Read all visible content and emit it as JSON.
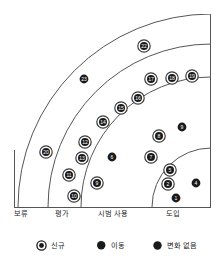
{
  "chart_data": {
    "type": "scatter",
    "chart_kind": "technology-radar-quadrant",
    "title": "",
    "xlabel": "",
    "ylabel": "",
    "rings": [
      {
        "name": "도입",
        "label": "도입",
        "order": 1
      },
      {
        "name": "시범 사용",
        "label": "시범 사용",
        "order": 2
      },
      {
        "name": "평가",
        "label": "평가",
        "order": 3
      },
      {
        "name": "보류",
        "label": "보류",
        "order": 4
      }
    ],
    "ring_labels": [
      "보류",
      "평가",
      "시범 사용",
      "도입"
    ],
    "legend": {
      "position": "bottom",
      "entries": [
        {
          "label": "신규",
          "marker": "ring-circle"
        },
        {
          "label": "이동",
          "marker": "moon-circle"
        },
        {
          "label": "변화 없음",
          "marker": "filled-circle"
        }
      ]
    },
    "points": [
      {
        "id": "1",
        "ring": "도입",
        "marker": "filled-circle",
        "x": 176,
        "y": 198
      },
      {
        "id": "2",
        "ring": "도입",
        "marker": "ring-circle",
        "x": 168,
        "y": 184
      },
      {
        "id": "4",
        "ring": "도입",
        "marker": "filled-circle",
        "x": 196,
        "y": 183
      },
      {
        "id": "5",
        "ring": "도입",
        "marker": "ring-circle",
        "x": 170,
        "y": 170
      },
      {
        "id": "7",
        "ring": "시범 사용",
        "marker": "ring-circle",
        "x": 151,
        "y": 157
      },
      {
        "id": "8",
        "ring": "시범 사용",
        "marker": "ring-circle",
        "x": 159,
        "y": 136
      },
      {
        "id": "9",
        "ring": "시범 사용",
        "marker": "moon-circle",
        "x": 182,
        "y": 127
      },
      {
        "id": "6",
        "ring": "시범 사용",
        "marker": "moon-circle",
        "x": 112,
        "y": 157
      },
      {
        "id": "9b",
        "ring": "시범 사용",
        "marker": "ring-circle",
        "x": 97,
        "y": 183,
        "display": "9"
      },
      {
        "id": "10",
        "ring": "평가",
        "marker": "ring-circle",
        "x": 74,
        "y": 196
      },
      {
        "id": "11",
        "ring": "평가",
        "marker": "ring-circle",
        "x": 69,
        "y": 175
      },
      {
        "id": "13",
        "ring": "평가",
        "marker": "ring-circle",
        "x": 82,
        "y": 158
      },
      {
        "id": "12",
        "ring": "평가",
        "marker": "ring-circle",
        "x": 85,
        "y": 142
      },
      {
        "id": "14",
        "ring": "평가",
        "marker": "ring-circle",
        "x": 103,
        "y": 122
      },
      {
        "id": "15",
        "ring": "시범 사용",
        "marker": "ring-circle",
        "x": 121,
        "y": 108
      },
      {
        "id": "16",
        "ring": "시범 사용",
        "marker": "ring-circle",
        "x": 138,
        "y": 98
      },
      {
        "id": "17",
        "ring": "시범 사용",
        "marker": "ring-circle",
        "x": 151,
        "y": 79
      },
      {
        "id": "18",
        "ring": "시범 사용",
        "marker": "ring-circle",
        "x": 172,
        "y": 78
      },
      {
        "id": "19",
        "ring": "시범 사용",
        "marker": "ring-circle",
        "x": 192,
        "y": 76
      },
      {
        "id": "20",
        "ring": "보류",
        "marker": "ring-circle",
        "x": 46,
        "y": 152
      },
      {
        "id": "22",
        "ring": "평가",
        "marker": "ring-circle",
        "x": 144,
        "y": 46
      },
      {
        "id": "23",
        "ring": "보류",
        "marker": "filled-circle",
        "x": 84,
        "y": 79
      }
    ],
    "grid": true,
    "axis_ranges": {
      "note": "polar quadrant, origin at bottom-right"
    }
  },
  "axis": {
    "labels": [
      {
        "text": "보류",
        "x": 14
      },
      {
        "text": "평가",
        "x": 55
      },
      {
        "text": "시범 사용",
        "x": 98
      },
      {
        "text": "도입",
        "x": 166
      }
    ]
  },
  "legend": {
    "items": [
      {
        "label": "신규",
        "x": 36,
        "marker": "ring-circle"
      },
      {
        "label": "이동",
        "x": 96,
        "marker": "moon-circle"
      },
      {
        "label": "변화 없음",
        "x": 152,
        "marker": "filled-circle"
      }
    ]
  },
  "colors": {
    "stroke": "#555555",
    "marker_stroke": "#3a3a3a",
    "marker_fill": "#1a1a1a",
    "text": "#1c1c1c",
    "background": "#ffffff"
  }
}
